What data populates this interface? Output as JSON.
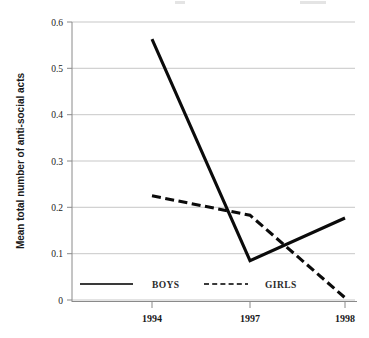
{
  "chart_data": {
    "type": "line",
    "title": "",
    "xlabel": "",
    "ylabel": "Mean total number of anti-social acts",
    "x": [
      "1994",
      "1997",
      "1998"
    ],
    "xtick_labels": [
      "1994",
      "1997",
      "1998"
    ],
    "ytick_labels": [
      "0",
      "0.1",
      "0.2",
      "0.3",
      "0.4",
      "0.5",
      "0.6"
    ],
    "ytick_values": [
      0,
      0.1,
      0.2,
      0.3,
      0.4,
      0.5,
      0.6
    ],
    "ylim": [
      0,
      0.6
    ],
    "grid": true,
    "legend_position": "inside-bottom",
    "series": [
      {
        "name": "BOYS",
        "style": "solid",
        "color": "#0b0b0b",
        "points": [
          {
            "x": "1994",
            "y": 0.563
          },
          {
            "x": "1997",
            "y": 0.085
          },
          {
            "x": "1998",
            "y": 0.177
          }
        ],
        "values": [
          0.563,
          0.085,
          0.177
        ]
      },
      {
        "name": "GIRLS",
        "style": "dashed",
        "color": "#0b0b0b",
        "points": [
          {
            "x": "1994",
            "y": 0.225
          },
          {
            "x": "1997",
            "y": 0.183
          },
          {
            "x": "1998",
            "y": 0.005
          }
        ],
        "values": [
          0.225,
          0.183,
          0.005
        ]
      }
    ]
  },
  "legend": {
    "entries": [
      {
        "label": "BOYS",
        "style": "solid"
      },
      {
        "label": "GIRLS",
        "style": "dashed"
      }
    ]
  },
  "axes": {
    "y_title": "Mean total number of anti-social acts",
    "y_ticks": [
      "0.6",
      "0.5",
      "0.4",
      "0.3",
      "0.2",
      "0.1",
      "0"
    ],
    "x_ticks": [
      "1994",
      "1997",
      "1998"
    ]
  }
}
